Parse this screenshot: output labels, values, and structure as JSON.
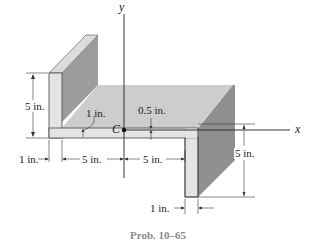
{
  "diagram": {
    "type": "engineering-cross-section",
    "axes": {
      "x": "x",
      "y": "y"
    },
    "centroid_label": "C",
    "dimensions": {
      "left_flange_height": "5 in.",
      "left_flange_thickness": "1 in.",
      "web_thickness_label": "1 in.",
      "web_half_thickness": "0.5 in.",
      "web_left_length": "5 in.",
      "web_right_length": "5 in.",
      "right_flange_height": "5 in.",
      "right_flange_thickness": "1 in."
    },
    "caption": "Prob. 10–65",
    "colors": {
      "front_face": "#e2e2e2",
      "top_face": "#cfcfcf",
      "side_face": "#9a9a9a",
      "line": "#222222",
      "caption": "#8a8a8a"
    }
  }
}
